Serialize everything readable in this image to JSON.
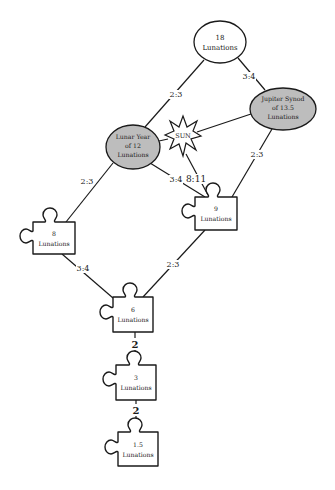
{
  "diagram": {
    "nodes": {
      "n18": {
        "line1": "18",
        "line2": "Lunations"
      },
      "jupiter": {
        "line1": "Jupiter Synod",
        "line2": "of 13.5",
        "line3": "Lunations"
      },
      "lunar_year": {
        "line1": "Lunar Year",
        "line2": "of 12",
        "line3": "Lunations"
      },
      "sun": {
        "label": "SUN"
      },
      "n9": {
        "line1": "9",
        "line2": "Lunations"
      },
      "n8": {
        "line1": "8",
        "line2": "Lunations"
      },
      "n6": {
        "line1": "6",
        "line2": "Lunations"
      },
      "n3": {
        "line1": "3",
        "line2": "Lunations"
      },
      "n1_5": {
        "line1": "1.5",
        "line2": "Lunations"
      }
    },
    "edges": {
      "n18_lunar_year": "2:3",
      "n18_jupiter": "3:4",
      "lunar_year_n8": "2:3",
      "lunar_year_n9": "3:4",
      "sun_n9": "8:11",
      "jupiter_n9": "2:3",
      "n8_n6": "3:4",
      "n9_n6": "2:3",
      "n6_n3": "2",
      "n3_n1_5": "2"
    },
    "colors": {
      "line": "#1a1a1a",
      "highlight_fill": "#bdbdbd",
      "background": "#ffffff"
    }
  }
}
